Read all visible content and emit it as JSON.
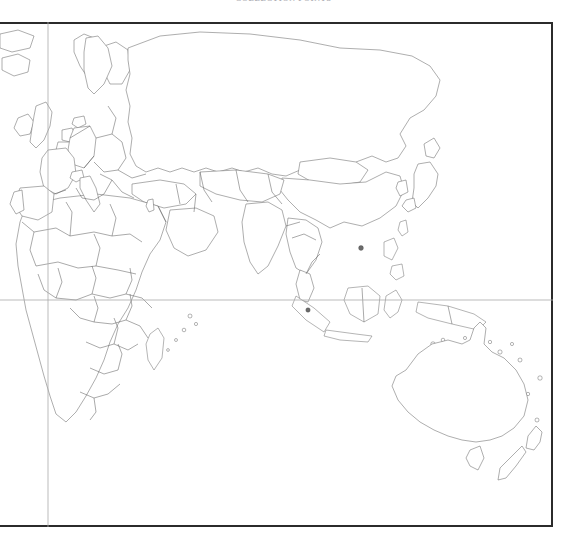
{
  "title": "COLLECTION POINTS",
  "frame": {
    "border_color": "#2b2b2b",
    "background": "#ffffff"
  },
  "graticule": {
    "color": "#a9a9a9",
    "lines": [
      {
        "name": "equator",
        "orientation": "horizontal",
        "y": 278
      },
      {
        "name": "prime-meridian",
        "orientation": "vertical",
        "x": 48
      }
    ]
  },
  "legend_shades": {
    "unshaded": "#ffffff",
    "very_light": "#ededed",
    "light": "#c9c9c9",
    "medium": "#9a9a9a",
    "dark": "#7a7a7a",
    "darkest": "#6b6b6b"
  },
  "map": {
    "projection_note": "eastern hemisphere world map",
    "shaded_regions": [
      {
        "name": "Iceland",
        "shade": "medium"
      },
      {
        "name": "Sweden",
        "shade": "dark"
      },
      {
        "name": "Ireland",
        "shade": "light"
      },
      {
        "name": "United Kingdom",
        "shade": "light"
      },
      {
        "name": "Netherlands",
        "shade": "darkest"
      },
      {
        "name": "Belgium",
        "shade": "darkest"
      },
      {
        "name": "Germany",
        "shade": "medium"
      },
      {
        "name": "France",
        "shade": "light"
      },
      {
        "name": "Spain",
        "shade": "light"
      },
      {
        "name": "Portugal",
        "shade": "light"
      },
      {
        "name": "Denmark",
        "shade": "medium"
      },
      {
        "name": "Switzerland",
        "shade": "medium"
      },
      {
        "name": "Italy",
        "shade": "very_light"
      },
      {
        "name": "Israel",
        "shade": "medium"
      },
      {
        "name": "Japan",
        "shade": "light"
      },
      {
        "name": "South Korea",
        "shade": "light"
      },
      {
        "name": "Hong Kong",
        "shade": "darkest"
      },
      {
        "name": "Singapore",
        "shade": "darkest"
      },
      {
        "name": "Australia",
        "shade": "medium"
      },
      {
        "name": "Tasmania",
        "shade": "medium"
      },
      {
        "name": "New Zealand",
        "shade": "medium"
      },
      {
        "name": "Russia",
        "shade": "very_light"
      },
      {
        "name": "Greenland",
        "shade": "very_light"
      },
      {
        "name": "Finland",
        "shade": "very_light"
      },
      {
        "name": "Norway",
        "shade": "unshaded"
      },
      {
        "name": "Taiwan",
        "shade": "very_light"
      }
    ]
  }
}
